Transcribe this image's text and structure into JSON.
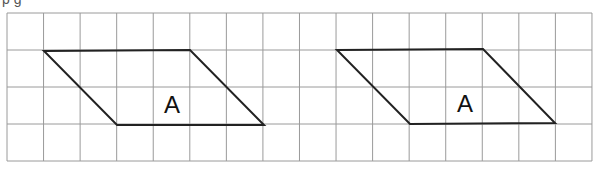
{
  "header": {
    "clipped_text": "p g"
  },
  "grid": {
    "x0": 7,
    "y0": 13,
    "cols": 16,
    "rows": 4,
    "cell_w": 36.56,
    "cell_h": 37,
    "line_color": "#9a9a9a"
  },
  "shapes": [
    {
      "label": "A",
      "type": "parallelogram",
      "points": [
        [
          44,
          51
        ],
        [
          190,
          50
        ],
        [
          264,
          125
        ],
        [
          117,
          125
        ]
      ],
      "label_pos": [
        172,
        113
      ]
    },
    {
      "label": "A",
      "type": "parallelogram",
      "points": [
        [
          337,
          50
        ],
        [
          483,
          49
        ],
        [
          555,
          123
        ],
        [
          410,
          124
        ]
      ],
      "label_pos": [
        465,
        112
      ]
    }
  ],
  "colors": {
    "outline": "#222222",
    "label": "#111111"
  }
}
